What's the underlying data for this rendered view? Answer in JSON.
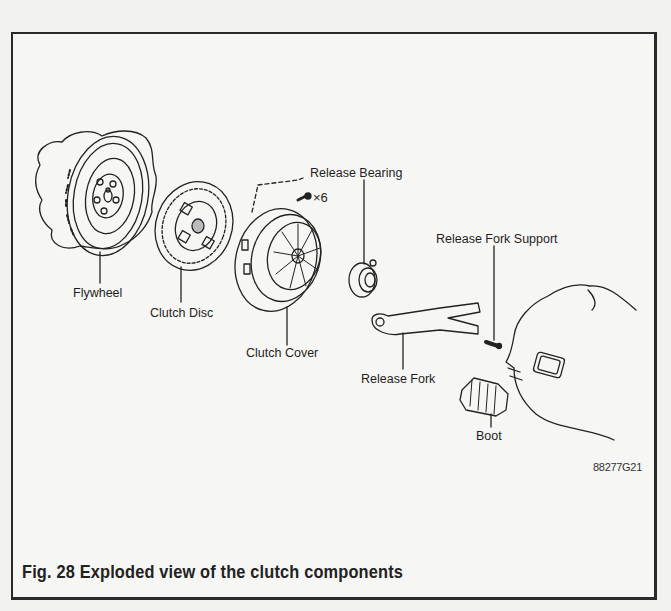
{
  "figure": {
    "number": "Fig. 28",
    "caption": "Fig. 28 Exploded view of the clutch components",
    "code": "88277G21"
  },
  "labels": {
    "flywheel": "Flywheel",
    "clutch_disc": "Clutch Disc",
    "clutch_cover": "Clutch Cover",
    "release_bearing": "Release Bearing",
    "bolt_qty": "×6",
    "release_fork_support": "Release Fork Support",
    "release_fork": "Release Fork",
    "boot": "Boot"
  }
}
